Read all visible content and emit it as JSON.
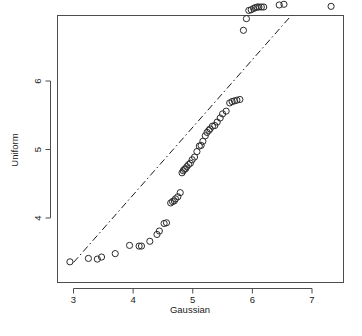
{
  "chart_data": {
    "type": "scatter",
    "title": "",
    "xlabel": "Gaussian",
    "ylabel": "Uniform",
    "xlim": [
      2.72,
      7.53
    ],
    "ylim": [
      3.3,
      7.22
    ],
    "xticks": [
      3,
      4,
      5,
      6,
      7
    ],
    "xticklabels": [
      "3",
      "4",
      "5",
      "6",
      "7"
    ],
    "yticks": [
      4,
      5,
      6
    ],
    "yticklabels": [
      "4",
      "5",
      "6"
    ],
    "grid": false,
    "legend": null,
    "point_marker": "open-circle",
    "point_count": 61,
    "reference_line": {
      "style": "dotdash",
      "description": "QQ reference line",
      "x_start": 3.0,
      "y_start": 3.35,
      "x_end": 6.93,
      "y_end": 7.23
    },
    "x": [
      2.94,
      3.25,
      3.4,
      3.47,
      3.7,
      3.94,
      4.1,
      4.14,
      4.28,
      4.4,
      4.44,
      4.52,
      4.56,
      4.63,
      4.66,
      4.69,
      4.71,
      4.75,
      4.79,
      4.82,
      4.84,
      4.86,
      4.88,
      4.9,
      4.93,
      4.96,
      4.99,
      5.03,
      5.07,
      5.11,
      5.14,
      5.17,
      5.21,
      5.24,
      5.27,
      5.29,
      5.33,
      5.37,
      5.41,
      5.46,
      5.5,
      5.56,
      5.62,
      5.66,
      5.7,
      5.74,
      5.79,
      5.85,
      5.9,
      5.94,
      5.98,
      6.02,
      6.05,
      6.08,
      6.11,
      6.15,
      6.19,
      6.45,
      6.53,
      7.32
    ],
    "y": [
      3.36,
      3.41,
      3.4,
      3.43,
      3.48,
      3.6,
      3.59,
      3.59,
      3.66,
      3.76,
      3.81,
      3.92,
      3.93,
      4.22,
      4.24,
      4.25,
      4.28,
      4.31,
      4.37,
      4.66,
      4.69,
      4.71,
      4.72,
      4.75,
      4.78,
      4.8,
      4.85,
      4.89,
      4.97,
      5.05,
      5.06,
      5.12,
      5.2,
      5.25,
      5.28,
      5.3,
      5.34,
      5.35,
      5.4,
      5.46,
      5.52,
      5.56,
      5.68,
      5.7,
      5.71,
      5.72,
      5.73,
      6.74,
      6.91,
      7.03,
      7.04,
      7.06,
      7.07,
      7.08,
      7.08,
      7.08,
      7.08,
      7.11,
      7.12,
      7.09
    ]
  },
  "axes": {
    "x_title": "Gaussian",
    "y_title": "Uniform"
  }
}
